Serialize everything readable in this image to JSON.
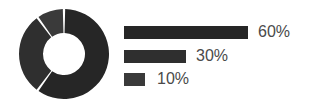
{
  "chart_data": {
    "type": "pie",
    "variant": "donut",
    "title": "",
    "categories": [
      "Segment 1",
      "Segment 2",
      "Segment 3"
    ],
    "values": [
      60,
      30,
      10
    ],
    "labels": [
      "60%",
      "30%",
      "10%"
    ],
    "legend_position": "right",
    "grid": false,
    "colors": {
      "segment_1": "#262626",
      "segment_2": "#2f2f2f",
      "segment_3": "#3a3a3a",
      "separator": "#ffffff",
      "background": "#ffffff",
      "label_text": "#4a4a4a"
    },
    "donut": {
      "center_x": 45,
      "center_y": 45,
      "outer_radius": 45,
      "inner_radius": 21,
      "start_angle_deg": -90,
      "gap_deg": 3
    },
    "legend_bars": {
      "max_bar_width": 124,
      "bar_height": 13,
      "widths": [
        124,
        62,
        21
      ]
    }
  }
}
